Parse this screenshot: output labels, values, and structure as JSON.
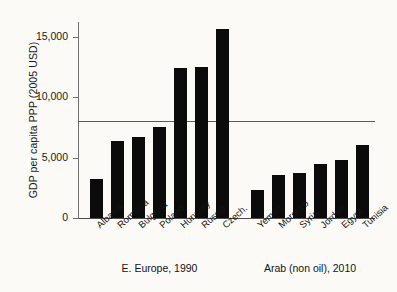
{
  "chart_data": {
    "type": "bar",
    "title": "",
    "xlabel": "",
    "ylabel": "GDP per capita PPP (2005 USD)",
    "ylim": [
      0,
      16200
    ],
    "yticks": [
      0,
      5000,
      10000,
      15000
    ],
    "ytick_labels": [
      "0",
      "5,000",
      "10,000",
      "15,000"
    ],
    "grid": false,
    "legend": "none",
    "bar_color": "#0b0b0b",
    "reference_line": {
      "value": 8000,
      "label": "",
      "color": "#5a5a5a"
    },
    "categories": [
      "Albania",
      "Romania",
      "Bulgaria",
      "Poland",
      "Hungary",
      "Russia",
      "Czech.",
      "Yemen",
      "Morocco",
      "Syria",
      "Jordan",
      "Egypt",
      "Tunisia"
    ],
    "values": [
      3250,
      6350,
      6700,
      7500,
      12400,
      12500,
      15600,
      2300,
      3550,
      3700,
      4450,
      4800,
      6000
    ],
    "groups": [
      {
        "caption": "E. Europe, 1990",
        "start": 0,
        "count": 7
      },
      {
        "caption": "Arab (non oil), 2010",
        "start": 7,
        "count": 6
      }
    ]
  }
}
